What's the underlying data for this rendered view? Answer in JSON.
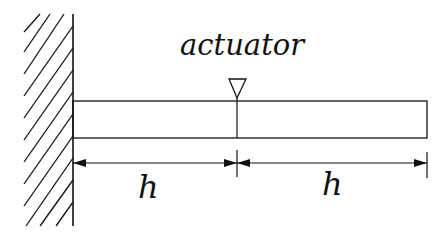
{
  "diagram": {
    "type": "cantilever-beam",
    "labels": {
      "actuator": "actuator",
      "length_left": "h",
      "length_right": "h"
    },
    "components": [
      "fixed wall (hatched)",
      "beam",
      "actuator marker (triangle)",
      "dimension arrows"
    ],
    "colors": {
      "stroke": "#111111",
      "background": "#ffffff"
    }
  }
}
